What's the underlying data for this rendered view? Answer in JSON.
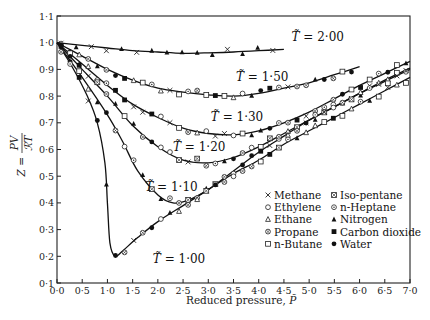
{
  "chart_data": {
    "type": "line",
    "title": "",
    "xlabel": "Reduced pressure, P̃",
    "ylabel": "Z = PV / ℛT",
    "xlim": [
      0.0,
      7.0
    ],
    "ylim": [
      0.1,
      1.1
    ],
    "grid": false,
    "x_ticks": [
      "0·0",
      "0·5",
      "1·0",
      "1·5",
      "2·0",
      "2·5",
      "3·0",
      "3·5",
      "4·0",
      "4·5",
      "5·0",
      "5·5",
      "6·0",
      "6·5",
      "7·0"
    ],
    "y_ticks": [
      "0·1",
      "0·2",
      "0·3",
      "0·4",
      "0·5",
      "0·6",
      "0·7",
      "0·8",
      "0·9",
      "1·0",
      "1·1"
    ],
    "series": [
      {
        "name": "T̃=2·00",
        "label": "T̃ = 2·00",
        "x": [
          0.0,
          0.5,
          1.0,
          1.5,
          2.0,
          2.5,
          3.0,
          3.5,
          4.0,
          4.5
        ],
        "y": [
          1.0,
          0.99,
          0.98,
          0.97,
          0.965,
          0.96,
          0.962,
          0.965,
          0.97,
          0.975
        ]
      },
      {
        "name": "T̃=1·50",
        "label": "T̃ = 1·50",
        "x": [
          0.0,
          0.5,
          1.0,
          1.5,
          2.0,
          2.5,
          3.0,
          3.5,
          4.0,
          4.5,
          5.0,
          5.5,
          6.0
        ],
        "y": [
          1.0,
          0.95,
          0.9,
          0.86,
          0.83,
          0.815,
          0.805,
          0.8,
          0.81,
          0.83,
          0.85,
          0.88,
          0.91
        ]
      },
      {
        "name": "T̃=1·30",
        "label": "T̃ = 1·30",
        "x": [
          0.0,
          0.5,
          1.0,
          1.5,
          2.0,
          2.5,
          3.0,
          3.5,
          4.0,
          4.5,
          5.0,
          5.5,
          6.0,
          6.5,
          7.0
        ],
        "y": [
          1.0,
          0.92,
          0.84,
          0.77,
          0.72,
          0.68,
          0.66,
          0.655,
          0.67,
          0.7,
          0.74,
          0.79,
          0.84,
          0.885,
          0.93
        ]
      },
      {
        "name": "T̃=1·20",
        "label": "T̃ = 1·20",
        "x": [
          0.0,
          0.5,
          1.0,
          1.5,
          2.0,
          2.5,
          3.0,
          3.5,
          4.0,
          4.5,
          5.0,
          5.5,
          6.0,
          6.5,
          7.0
        ],
        "y": [
          1.0,
          0.9,
          0.8,
          0.69,
          0.61,
          0.56,
          0.55,
          0.57,
          0.61,
          0.66,
          0.71,
          0.76,
          0.81,
          0.86,
          0.905
        ]
      },
      {
        "name": "T̃=1·10",
        "label": "T̃ = 1·10",
        "x": [
          0.0,
          0.5,
          1.0,
          1.3,
          1.6,
          2.0,
          2.3,
          2.6,
          3.0,
          3.5,
          4.0,
          4.5,
          5.0,
          5.5,
          6.0,
          6.5,
          7.0
        ],
        "y": [
          1.0,
          0.87,
          0.73,
          0.63,
          0.52,
          0.43,
          0.4,
          0.41,
          0.45,
          0.52,
          0.59,
          0.65,
          0.71,
          0.76,
          0.81,
          0.855,
          0.9
        ]
      },
      {
        "name": "T̃=1·00",
        "label": "T̃ = 1·00",
        "x": [
          0.0,
          0.3,
          0.6,
          0.8,
          0.95,
          1.0,
          1.05,
          1.15,
          1.3,
          1.6,
          2.0,
          2.5,
          3.0,
          3.5,
          4.0,
          4.5,
          5.0,
          5.5,
          6.0,
          6.5,
          7.0
        ],
        "y": [
          1.0,
          0.91,
          0.8,
          0.7,
          0.55,
          0.4,
          0.25,
          0.2,
          0.22,
          0.27,
          0.33,
          0.39,
          0.45,
          0.51,
          0.56,
          0.62,
          0.67,
          0.72,
          0.77,
          0.82,
          0.87
        ]
      }
    ],
    "legend": {
      "position": "lower right (inside)",
      "entries": [
        {
          "marker": "×",
          "label": "Methane"
        },
        {
          "marker": "○",
          "label": "Ethylene"
        },
        {
          "marker": "△",
          "label": "Ethane"
        },
        {
          "marker": "⊗",
          "label": "Propane"
        },
        {
          "marker": "□",
          "label": "n-Butane"
        },
        {
          "marker": "⊠",
          "label": "Iso-pentane"
        },
        {
          "marker": "⊙",
          "label": "n-Heptane"
        },
        {
          "marker": "▲",
          "label": "Nitrogen"
        },
        {
          "marker": "■",
          "label": "Carbon dioxide"
        },
        {
          "marker": "●",
          "label": "Water"
        }
      ]
    }
  },
  "axes": {
    "x_title": "Reduced pressure, ",
    "x_symbol": "P̃",
    "y_title_lhs": "Z =",
    "y_title_num": "PV",
    "y_title_den": "ℛT"
  },
  "colors": {
    "ink": "#1a1a1a",
    "background": "#ffffff"
  }
}
